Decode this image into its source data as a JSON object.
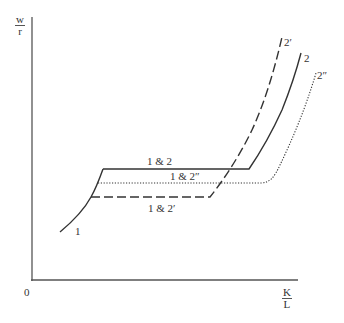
{
  "axes": {
    "y_label": {
      "numerator": "w",
      "denominator": "r"
    },
    "x_label": {
      "numerator": "K",
      "denominator": "L"
    },
    "origin_label": "0"
  },
  "curve_labels": {
    "curve_1": "1",
    "curve_2": "2",
    "curve_2_prime": "2′",
    "curve_2_double_prime": "2″",
    "plateau_1_2": "1 & 2",
    "plateau_1_2_double_prime": "1 & 2″",
    "plateau_1_2_prime": "1 & 2′"
  },
  "styles": {
    "line_color": "#333333",
    "axis_color": "#555555"
  },
  "curves": [
    {
      "name": "1",
      "style": "solid",
      "description": "rising segment from lower-left joining plateaus"
    },
    {
      "name": "1 & 2",
      "style": "solid",
      "plateau_y": "highest"
    },
    {
      "name": "1 & 2″",
      "style": "dotted",
      "plateau_y": "middle"
    },
    {
      "name": "1 & 2′",
      "style": "dashed",
      "plateau_y": "lowest"
    },
    {
      "name": "2",
      "style": "solid",
      "rises_at": "middle"
    },
    {
      "name": "2′",
      "style": "dashed",
      "rises_at": "earliest"
    },
    {
      "name": "2″",
      "style": "dotted",
      "rises_at": "latest"
    }
  ]
}
